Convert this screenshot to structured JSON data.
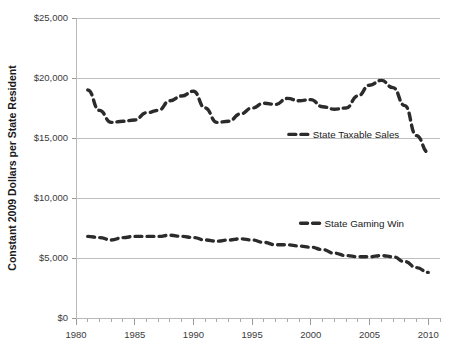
{
  "chart_data": {
    "type": "line",
    "title": "",
    "xlabel": "",
    "ylabel": "Constant 2009 Dollars per State Resident",
    "xlim": [
      1980,
      2011
    ],
    "ylim": [
      0,
      25000
    ],
    "grid": true,
    "legend_position": "inline-right-of-series",
    "x_tick_labels": [
      "1980",
      "1985",
      "1990",
      "1995",
      "2000",
      "2005",
      "2010"
    ],
    "x_tick_values": [
      1980,
      1985,
      1990,
      1995,
      2000,
      2005,
      2010
    ],
    "x_minor_tick_step": 1,
    "y_tick_labels": [
      "$0",
      "$5,000",
      "$10,000",
      "$15,000",
      "$20,000",
      "$25,000"
    ],
    "y_tick_values": [
      0,
      5000,
      10000,
      15000,
      20000,
      25000
    ],
    "x": [
      1981,
      1982,
      1983,
      1984,
      1985,
      1986,
      1987,
      1988,
      1989,
      1990,
      1991,
      1992,
      1993,
      1994,
      1995,
      1996,
      1997,
      1998,
      1999,
      2000,
      2001,
      2002,
      2003,
      2004,
      2005,
      2006,
      2007,
      2008,
      2009,
      2010
    ],
    "series": [
      {
        "name": "State Taxable Sales",
        "line_style": "dashed",
        "color": "#2b2b2b",
        "values": [
          19000,
          17300,
          16300,
          16400,
          16500,
          17100,
          17300,
          18100,
          18500,
          18900,
          17500,
          16300,
          16400,
          17000,
          17500,
          17900,
          17800,
          18300,
          18100,
          18200,
          17600,
          17400,
          17500,
          18500,
          19400,
          19800,
          19200,
          17700,
          15200,
          13800
        ]
      },
      {
        "name": "State Gaming Win",
        "line_style": "dashed",
        "color": "#2b2b2b",
        "values": [
          6800,
          6700,
          6500,
          6700,
          6800,
          6800,
          6800,
          6900,
          6800,
          6700,
          6500,
          6400,
          6500,
          6600,
          6500,
          6300,
          6100,
          6100,
          6000,
          5900,
          5700,
          5400,
          5200,
          5100,
          5100,
          5200,
          5100,
          4700,
          4200,
          3800
        ]
      }
    ]
  },
  "legend": {
    "items": [
      {
        "label": "State Taxable Sales",
        "anchor_x": 2000,
        "anchor_y": 15300
      },
      {
        "label": "State Gaming Win",
        "anchor_x": 2001,
        "anchor_y": 7900
      }
    ]
  }
}
